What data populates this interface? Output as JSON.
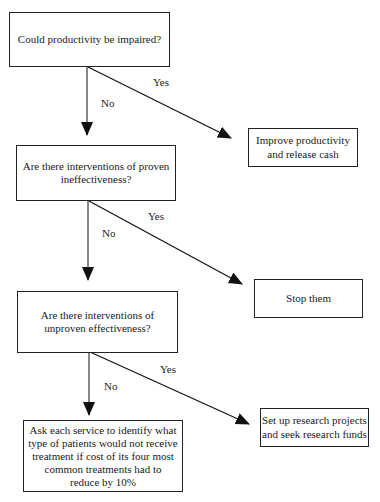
{
  "flowchart": {
    "nodes": [
      {
        "id": "q1",
        "text": "Could productivity be impaired?"
      },
      {
        "id": "a1",
        "text": "Improve productivity and release cash",
        "lines": [
          "Improve productivity",
          "and release cash"
        ]
      },
      {
        "id": "q2",
        "text": "Are there interventions of proven ineffectiveness?",
        "lines": [
          "Are there interventions of proven",
          "ineffectiveness?"
        ]
      },
      {
        "id": "a2",
        "text": "Stop them"
      },
      {
        "id": "q3",
        "text": "Are there interventions of unproven effectiveness?",
        "lines": [
          "Are there interventions of",
          "unproven effectiveness?"
        ]
      },
      {
        "id": "a3",
        "text": "Set up research projects and seek research funds",
        "lines": [
          "Set up research projects",
          "and seek research funds"
        ]
      },
      {
        "id": "a4",
        "text": "Ask each service to identify what type of patients would not receive treatment if cost of its four most common treatments had to reduce by 10%",
        "lines": [
          "Ask each service to identify what",
          "type of patients would not receive",
          "treatment if cost of its four most",
          "common treatments had to",
          "reduce by 10%"
        ]
      }
    ],
    "edges": [
      {
        "from": "q1",
        "to": "q2",
        "label": "No"
      },
      {
        "from": "q1",
        "to": "a1",
        "label": "Yes"
      },
      {
        "from": "q2",
        "to": "q3",
        "label": "No"
      },
      {
        "from": "q2",
        "to": "a2",
        "label": "Yes"
      },
      {
        "from": "q3",
        "to": "a4",
        "label": "No"
      },
      {
        "from": "q3",
        "to": "a3",
        "label": "Yes"
      }
    ]
  }
}
